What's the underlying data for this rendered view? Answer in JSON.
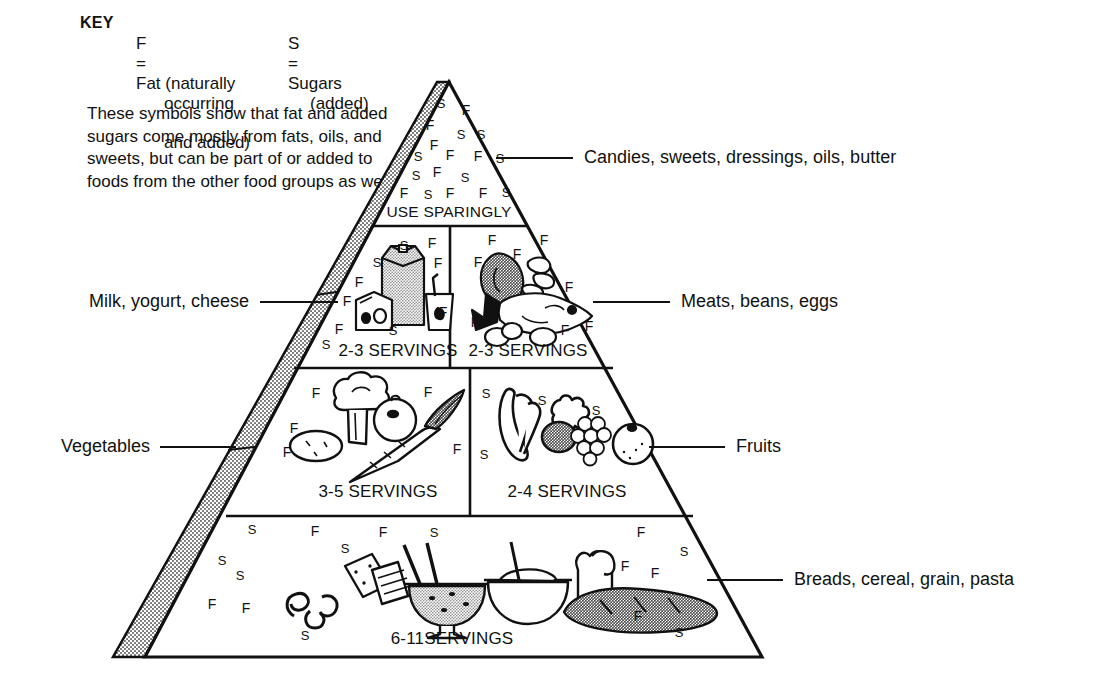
{
  "key": {
    "title": "KEY",
    "fat": {
      "symbol": "F",
      "equals": "=",
      "line1": "Fat (naturally",
      "line2": "occurring",
      "line3": "and added)"
    },
    "sugars": {
      "symbol": "S",
      "equals": "=",
      "line1": "Sugars",
      "line2": "(added)"
    },
    "note": "These symbols show that fat and added sugars come mostly from fats, oils, and sweets, but can be part of or added to foods from the other food groups as well."
  },
  "pyramid": {
    "tiers": [
      {
        "id": "tip",
        "caption": "USE SPARINGLY",
        "label": "Candies, sweets, dressings, oils, butter",
        "label_side": "right"
      },
      {
        "id": "milk",
        "caption": "2-3 SERVINGS",
        "label": "Milk, yogurt, cheese",
        "label_side": "left"
      },
      {
        "id": "meat",
        "caption": "2-3 SERVINGS",
        "label": "Meats, beans, eggs",
        "label_side": "right"
      },
      {
        "id": "vegetables",
        "caption": "3-5 SERVINGS",
        "label": "Vegetables",
        "label_side": "left"
      },
      {
        "id": "fruits",
        "caption": "2-4 SERVINGS",
        "label": "Fruits",
        "label_side": "right"
      },
      {
        "id": "breads",
        "caption": "6-11SERVINGS",
        "label": "Breads, cereal, grain, pasta",
        "label_side": "right"
      }
    ]
  },
  "symbols": {
    "tip": [
      {
        "t": "S",
        "x": 441,
        "y": 103
      },
      {
        "t": "F",
        "x": 466,
        "y": 110
      },
      {
        "t": "F",
        "x": 430,
        "y": 125
      },
      {
        "t": "S",
        "x": 461,
        "y": 134
      },
      {
        "t": "S",
        "x": 481,
        "y": 134
      },
      {
        "t": "F",
        "x": 434,
        "y": 145
      },
      {
        "t": "S",
        "x": 418,
        "y": 156
      },
      {
        "t": "F",
        "x": 450,
        "y": 155
      },
      {
        "t": "F",
        "x": 478,
        "y": 156
      },
      {
        "t": "S",
        "x": 500,
        "y": 158
      },
      {
        "t": "S",
        "x": 416,
        "y": 175
      },
      {
        "t": "F",
        "x": 437,
        "y": 172
      },
      {
        "t": "S",
        "x": 465,
        "y": 177
      },
      {
        "t": "F",
        "x": 404,
        "y": 193
      },
      {
        "t": "S",
        "x": 428,
        "y": 194
      },
      {
        "t": "F",
        "x": 450,
        "y": 193
      },
      {
        "t": "F",
        "x": 483,
        "y": 193
      },
      {
        "t": "S",
        "x": 506,
        "y": 192
      }
    ],
    "milk": [
      {
        "t": "S",
        "x": 404,
        "y": 245
      },
      {
        "t": "F",
        "x": 432,
        "y": 243
      },
      {
        "t": "S",
        "x": 377,
        "y": 262
      },
      {
        "t": "F",
        "x": 438,
        "y": 263
      },
      {
        "t": "F",
        "x": 359,
        "y": 282
      },
      {
        "t": "F",
        "x": 347,
        "y": 301
      },
      {
        "t": "F",
        "x": 443,
        "y": 312
      },
      {
        "t": "F",
        "x": 339,
        "y": 329
      },
      {
        "t": "S",
        "x": 393,
        "y": 330
      },
      {
        "t": "S",
        "x": 326,
        "y": 344
      }
    ],
    "meat": [
      {
        "t": "F",
        "x": 492,
        "y": 240
      },
      {
        "t": "F",
        "x": 544,
        "y": 240
      },
      {
        "t": "F",
        "x": 517,
        "y": 254
      },
      {
        "t": "F",
        "x": 478,
        "y": 262
      },
      {
        "t": "F",
        "x": 569,
        "y": 287
      },
      {
        "t": "F",
        "x": 475,
        "y": 322
      },
      {
        "t": "F",
        "x": 565,
        "y": 330
      },
      {
        "t": "F",
        "x": 589,
        "y": 326
      }
    ],
    "vegetables": [
      {
        "t": "F",
        "x": 316,
        "y": 393
      },
      {
        "t": "F",
        "x": 428,
        "y": 392
      },
      {
        "t": "F",
        "x": 294,
        "y": 428
      },
      {
        "t": "F",
        "x": 287,
        "y": 452
      },
      {
        "t": "F",
        "x": 457,
        "y": 449
      }
    ],
    "fruits": [
      {
        "t": "S",
        "x": 486,
        "y": 393
      },
      {
        "t": "S",
        "x": 542,
        "y": 400
      },
      {
        "t": "S",
        "x": 596,
        "y": 410
      },
      {
        "t": "S",
        "x": 484,
        "y": 454
      }
    ],
    "breads": [
      {
        "t": "S",
        "x": 252,
        "y": 529
      },
      {
        "t": "F",
        "x": 315,
        "y": 531
      },
      {
        "t": "F",
        "x": 383,
        "y": 532
      },
      {
        "t": "S",
        "x": 434,
        "y": 532
      },
      {
        "t": "F",
        "x": 641,
        "y": 532
      },
      {
        "t": "S",
        "x": 345,
        "y": 548
      },
      {
        "t": "S",
        "x": 684,
        "y": 551
      },
      {
        "t": "S",
        "x": 222,
        "y": 560
      },
      {
        "t": "F",
        "x": 625,
        "y": 566
      },
      {
        "t": "S",
        "x": 240,
        "y": 575
      },
      {
        "t": "F",
        "x": 655,
        "y": 573
      },
      {
        "t": "F",
        "x": 212,
        "y": 604
      },
      {
        "t": "F",
        "x": 246,
        "y": 608
      },
      {
        "t": "S",
        "x": 305,
        "y": 635
      },
      {
        "t": "F",
        "x": 638,
        "y": 616
      },
      {
        "t": "S",
        "x": 679,
        "y": 632
      }
    ]
  },
  "colors": {
    "stroke": "#111111",
    "stipple": "#9a9a9a",
    "background": "#ffffff",
    "text": "#111111"
  }
}
